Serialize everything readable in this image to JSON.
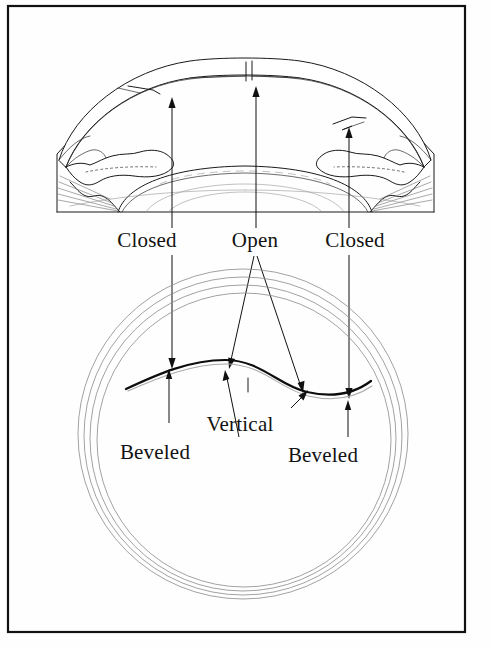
{
  "figure": {
    "border_color": "#111111",
    "ink_color": "#1a1a1a",
    "background_color": "#fefefe"
  },
  "top_panel": {
    "name": "eye-cross-section",
    "description": "Sagittal cross-section of the anterior segment showing cornea, iris, ciliary body and lens with incision sites",
    "parts": [
      "cornea",
      "iris",
      "ciliary-body",
      "lens",
      "zonular-fibers",
      "sclera"
    ]
  },
  "bottom_panel": {
    "name": "limbus-frontal-view",
    "description": "Frontal view of the limbus with concentric rings and an S-shaped incision profile",
    "ring_count": 4
  },
  "labels": {
    "closed_left": "Closed",
    "open": "Open",
    "closed_right": "Closed",
    "beveled_left": "Beveled",
    "vertical": "Vertical",
    "beveled_right": "Beveled"
  },
  "annotations": [
    {
      "id": "closed-left",
      "text": "Closed",
      "x": 147,
      "y": 247,
      "points_to": "cornea-left-incision"
    },
    {
      "id": "open",
      "text": "Open",
      "x": 255,
      "y": 247,
      "points_to": "cornea-center-incision"
    },
    {
      "id": "closed-right",
      "text": "Closed",
      "x": 355,
      "y": 247,
      "points_to": "cornea-right-incision"
    },
    {
      "id": "beveled-left",
      "text": "Beveled",
      "x": 155,
      "y": 459,
      "points_to": "incision-left-segment"
    },
    {
      "id": "vertical",
      "text": "Vertical",
      "x": 240,
      "y": 431,
      "points_to": "incision-mid-segment"
    },
    {
      "id": "beveled-right",
      "text": "Beveled",
      "x": 323,
      "y": 462,
      "points_to": "incision-right-segment"
    }
  ]
}
